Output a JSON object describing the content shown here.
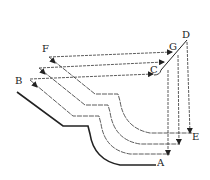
{
  "diagram": {
    "type": "moulding-profile-projection",
    "labels": {
      "A": "A",
      "B": "B",
      "C": "C",
      "D": "D",
      "E": "E",
      "F": "F",
      "G": "G"
    },
    "colors": {
      "line": "#222222",
      "dashed": "#444444",
      "background": "#ffffff"
    }
  }
}
